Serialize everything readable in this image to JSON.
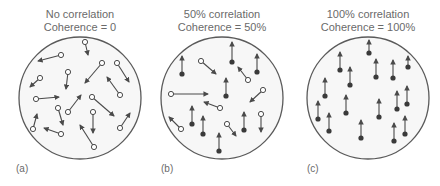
{
  "figure": {
    "panels": [
      {
        "id": "a",
        "label": "(a)",
        "title_line1": "No correlation",
        "title_line2": "Coherence = 0",
        "coherence_percent": 0,
        "circle": {
          "cx": 80,
          "cy": 98,
          "r": 61
        },
        "dots": [
          {
            "x": 85,
            "y": 42,
            "tx": 88,
            "ty": 55,
            "type": "random"
          },
          {
            "x": 61,
            "y": 55,
            "tx": 38,
            "ty": 61,
            "type": "random"
          },
          {
            "x": 102,
            "y": 63,
            "tx": 85,
            "ty": 83,
            "type": "random"
          },
          {
            "x": 117,
            "y": 63,
            "tx": 129,
            "ty": 82,
            "type": "random"
          },
          {
            "x": 40,
            "y": 78,
            "tx": 30,
            "ty": 87,
            "type": "random"
          },
          {
            "x": 68,
            "y": 72,
            "tx": 66,
            "ty": 89,
            "type": "random"
          },
          {
            "x": 36,
            "y": 99,
            "tx": 59,
            "ty": 97,
            "type": "random"
          },
          {
            "x": 92,
            "y": 97,
            "tx": 114,
            "ty": 116,
            "type": "random"
          },
          {
            "x": 120,
            "y": 95,
            "tx": 107,
            "ty": 77,
            "type": "random"
          },
          {
            "x": 58,
            "y": 108,
            "tx": 63,
            "ty": 125,
            "type": "random"
          },
          {
            "x": 68,
            "y": 112,
            "tx": 81,
            "ty": 95,
            "type": "random"
          },
          {
            "x": 93,
            "y": 112,
            "tx": 93,
            "ty": 133,
            "type": "random"
          },
          {
            "x": 33,
            "y": 129,
            "tx": 37,
            "ty": 114,
            "type": "random"
          },
          {
            "x": 61,
            "y": 134,
            "tx": 44,
            "ty": 128,
            "type": "random"
          },
          {
            "x": 120,
            "y": 128,
            "tx": 130,
            "ty": 113,
            "type": "random"
          },
          {
            "x": 94,
            "y": 147,
            "tx": 80,
            "ty": 125,
            "type": "random"
          }
        ]
      },
      {
        "id": "b",
        "label": "(b)",
        "title_line1": "50% correlation",
        "title_line2": "Coherence = 50%",
        "coherence_percent": 50,
        "circle": {
          "cx": 222,
          "cy": 98,
          "r": 61
        },
        "dots": [
          {
            "x": 182,
            "y": 74,
            "tx": 182,
            "ty": 56,
            "type": "coherent"
          },
          {
            "x": 232,
            "y": 62,
            "tx": 232,
            "ty": 42,
            "type": "coherent"
          },
          {
            "x": 257,
            "y": 72,
            "tx": 257,
            "ty": 54,
            "type": "coherent"
          },
          {
            "x": 226,
            "y": 96,
            "tx": 226,
            "ty": 78,
            "type": "coherent"
          },
          {
            "x": 192,
            "y": 124,
            "tx": 192,
            "ty": 106,
            "type": "coherent"
          },
          {
            "x": 203,
            "y": 134,
            "tx": 203,
            "ty": 116,
            "type": "coherent"
          },
          {
            "x": 244,
            "y": 130,
            "tx": 244,
            "ty": 112,
            "type": "coherent"
          },
          {
            "x": 219,
            "y": 151,
            "tx": 219,
            "ty": 133,
            "type": "coherent"
          },
          {
            "x": 201,
            "y": 61,
            "tx": 216,
            "ty": 74,
            "type": "random"
          },
          {
            "x": 248,
            "y": 80,
            "tx": 238,
            "ty": 67,
            "type": "random"
          },
          {
            "x": 171,
            "y": 94,
            "tx": 208,
            "ty": 94,
            "type": "random"
          },
          {
            "x": 263,
            "y": 90,
            "tx": 250,
            "ty": 102,
            "type": "random"
          },
          {
            "x": 220,
            "y": 108,
            "tx": 204,
            "ty": 102,
            "type": "random"
          },
          {
            "x": 181,
            "y": 129,
            "tx": 169,
            "ty": 117,
            "type": "random"
          },
          {
            "x": 227,
            "y": 124,
            "tx": 236,
            "ty": 136,
            "type": "random"
          },
          {
            "x": 261,
            "y": 114,
            "tx": 261,
            "ty": 132,
            "type": "random"
          }
        ]
      },
      {
        "id": "c",
        "label": "(c)",
        "title_line1": "100% correlation",
        "title_line2": "Coherence = 100%",
        "coherence_percent": 100,
        "circle": {
          "cx": 368,
          "cy": 98,
          "r": 61
        },
        "dots": [
          {
            "x": 369,
            "y": 53,
            "tx": 369,
            "ty": 40,
            "type": "coherent"
          },
          {
            "x": 340,
            "y": 70,
            "tx": 340,
            "ty": 52,
            "type": "coherent"
          },
          {
            "x": 376,
            "y": 77,
            "tx": 376,
            "ty": 59,
            "type": "coherent"
          },
          {
            "x": 393,
            "y": 78,
            "tx": 393,
            "ty": 60,
            "type": "coherent"
          },
          {
            "x": 408,
            "y": 67,
            "tx": 408,
            "ty": 56,
            "type": "coherent"
          },
          {
            "x": 350,
            "y": 85,
            "tx": 350,
            "ty": 67,
            "type": "coherent"
          },
          {
            "x": 325,
            "y": 96,
            "tx": 325,
            "ty": 78,
            "type": "coherent"
          },
          {
            "x": 346,
            "y": 113,
            "tx": 346,
            "ty": 95,
            "type": "coherent"
          },
          {
            "x": 318,
            "y": 119,
            "tx": 318,
            "ty": 101,
            "type": "coherent"
          },
          {
            "x": 379,
            "y": 117,
            "tx": 379,
            "ty": 99,
            "type": "coherent"
          },
          {
            "x": 397,
            "y": 109,
            "tx": 397,
            "ty": 91,
            "type": "coherent"
          },
          {
            "x": 407,
            "y": 104,
            "tx": 407,
            "ty": 86,
            "type": "coherent"
          },
          {
            "x": 329,
            "y": 131,
            "tx": 329,
            "ty": 113,
            "type": "coherent"
          },
          {
            "x": 361,
            "y": 138,
            "tx": 361,
            "ty": 120,
            "type": "coherent"
          },
          {
            "x": 394,
            "y": 141,
            "tx": 394,
            "ty": 123,
            "type": "coherent"
          },
          {
            "x": 405,
            "y": 134,
            "tx": 405,
            "ty": 116,
            "type": "coherent"
          }
        ]
      }
    ],
    "colors": {
      "circle_stroke": "#5a5a5a",
      "circle_fill": "#f7f7f7",
      "arrow": "#4a4a4a",
      "coherent_dot": "#3a3a3a",
      "random_dot_fill": "#ffffff",
      "text": "#6a6a6a"
    }
  }
}
